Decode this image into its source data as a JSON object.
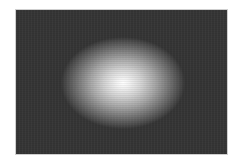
{
  "image": {
    "description": "Dark gray rectangle with a soft white elliptical glow in the center",
    "colors": {
      "background": "#353535",
      "glow_center": "#ffffff",
      "border": "#cfcfcf",
      "page": "#ffffff"
    }
  }
}
